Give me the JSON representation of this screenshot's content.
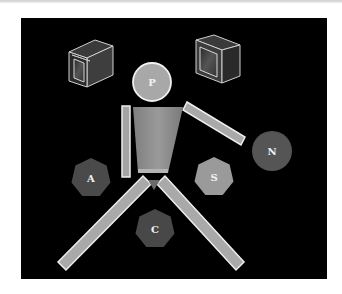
{
  "diagram": {
    "background": "#000000",
    "nodes": {
      "head": {
        "label": "P",
        "shape": "circle",
        "color": "#a8a8a8"
      },
      "node_a": {
        "label": "A",
        "shape": "heptagon",
        "color": "#4a4a4a"
      },
      "node_s": {
        "label": "S",
        "shape": "heptagon",
        "color": "#9a9a9a"
      },
      "node_c": {
        "label": "C",
        "shape": "heptagon",
        "color": "#484848"
      },
      "node_n": {
        "label": "N",
        "shape": "circle",
        "color": "#555555"
      }
    },
    "body_color": "#8c8c8c",
    "limb_color": "#a9a9a9",
    "outline_color": "#eeeeee",
    "monitors": [
      {
        "name": "left-monitor"
      },
      {
        "name": "right-monitor"
      }
    ]
  }
}
